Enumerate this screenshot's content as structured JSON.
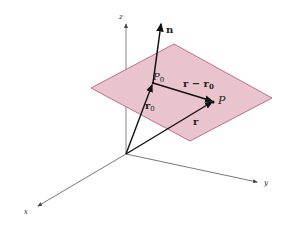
{
  "diagram": {
    "title": "",
    "colors": {
      "plane_fill": "#e9c4cd",
      "plane_stroke": "#c0607a",
      "axis": "#555555",
      "vector": "#1a1a1a"
    },
    "axes": {
      "z_label": "z",
      "y_label": "y",
      "x_label": "x"
    },
    "vectors": {
      "n_label": "n",
      "r0_label": "r",
      "r0_sub": "0",
      "r_label": "r",
      "r_minus_r0_label": "r − r",
      "r_minus_r0_sub": "0"
    },
    "points": {
      "P0_label": "P",
      "P0_sub": "0",
      "P_label": "P"
    }
  }
}
